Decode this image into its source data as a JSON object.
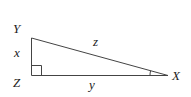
{
  "diagram": {
    "type": "right-triangle",
    "vertices": {
      "Y": {
        "label": "Y"
      },
      "Z": {
        "label": "Z"
      },
      "X": {
        "label": "X"
      }
    },
    "sides": {
      "YZ": {
        "label": "x"
      },
      "ZX": {
        "label": "y"
      },
      "YX": {
        "label": "z"
      }
    },
    "right_angle_at": "Z",
    "marked_angle_at": "X",
    "stroke_color": "#444444"
  }
}
